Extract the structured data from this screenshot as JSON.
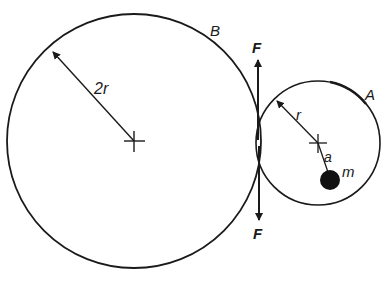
{
  "diagram": {
    "type": "mechanics-gear-pair",
    "colors": {
      "ink": "#1a1a1a",
      "background": "#ffffff"
    },
    "circle_B": {
      "label": "B",
      "radius_label": "2r",
      "center": [
        134,
        141
      ],
      "radius": 127
    },
    "circle_A": {
      "label": "A",
      "radius_label": "r",
      "center": [
        318,
        143
      ],
      "radius": 62
    },
    "mass": {
      "label": "m",
      "offset_label": "a",
      "center": [
        330,
        180
      ],
      "radius": 10
    },
    "force_up": {
      "label": "F"
    },
    "force_down": {
      "label": "F"
    }
  }
}
